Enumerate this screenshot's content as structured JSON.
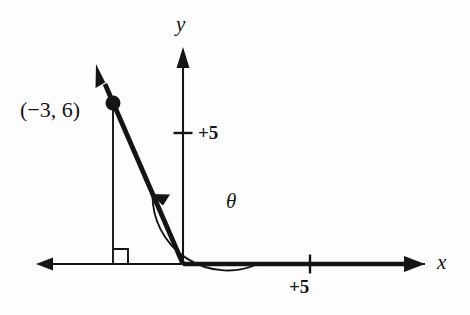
{
  "figure": {
    "background_color": "#fdfdfd",
    "ink_color": "#141414"
  },
  "axes": {
    "x_label": "x",
    "y_label": "y",
    "x_tick_label": "+5",
    "y_tick_label": "+5",
    "origin": {
      "x": 183,
      "y": 264
    },
    "x_axis": {
      "left_end": 36,
      "right_end": 425,
      "y": 264
    },
    "y_axis": {
      "top_end": 47,
      "bottom": 264,
      "x": 183
    },
    "x_tick": {
      "x": 310,
      "half_length": 9
    },
    "y_tick": {
      "y": 133,
      "half_length": 9
    },
    "unit_px_per_5": 127
  },
  "point": {
    "label": "(−3, 6)",
    "coordinates": {
      "x": -3,
      "y": 6
    },
    "pixel": {
      "x": 113,
      "y": 103
    },
    "marker": "filled-dot"
  },
  "terminal_ray": {
    "from": {
      "x": 183,
      "y": 264
    },
    "through": {
      "x": 113,
      "y": 103
    },
    "arrow_tip": {
      "x": 96,
      "y": 64
    },
    "stroke_width": 4.6
  },
  "drop_line": {
    "from": {
      "x": 113,
      "y": 103
    },
    "to": {
      "x": 113,
      "y": 264
    },
    "stroke_width": 1.7
  },
  "right_angle_marker": {
    "corner": {
      "x": 113,
      "y": 264
    },
    "size": 15,
    "direction": "right-of-vertical-above-axis"
  },
  "angle_arc": {
    "label": "θ",
    "center": {
      "x": 183,
      "y": 264
    },
    "radius": 75,
    "start_deg": 0,
    "end_deg": 114,
    "arrow_at": "end",
    "stroke_width": 1.7
  },
  "initial_side": {
    "description": "bold segment of positive x-axis forming initial side",
    "from": {
      "x": 183,
      "y": 264
    },
    "to": {
      "x": 415,
      "y": 264
    },
    "stroke_width": 4.2
  }
}
